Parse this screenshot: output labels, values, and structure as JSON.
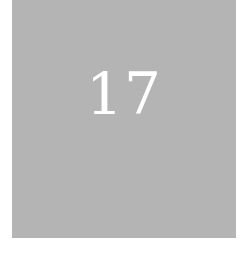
{
  "tile": {
    "number": "17",
    "background_color": "#b4b4b4",
    "text_color": "#ffffff"
  }
}
